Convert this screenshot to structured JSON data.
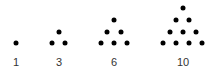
{
  "color": "#000000",
  "groups": [
    {
      "label": "1",
      "label_x": 16,
      "dots": [
        [
          16,
          43
        ]
      ]
    },
    {
      "label": "3",
      "label_x": 59,
      "dots": [
        [
          59,
          32
        ],
        [
          52,
          43
        ],
        [
          65,
          43
        ]
      ]
    },
    {
      "label": "6",
      "label_x": 114,
      "dots": [
        [
          114,
          20
        ],
        [
          107,
          32
        ],
        [
          121,
          32
        ],
        [
          101,
          43
        ],
        [
          114,
          43
        ],
        [
          127,
          43
        ]
      ]
    },
    {
      "label": "10",
      "label_x": 183,
      "dots": [
        [
          183,
          8
        ],
        [
          176,
          20
        ],
        [
          189,
          20
        ],
        [
          170,
          32
        ],
        [
          183,
          32
        ],
        [
          196,
          32
        ],
        [
          163,
          43
        ],
        [
          176,
          43
        ],
        [
          189,
          43
        ],
        [
          202,
          43
        ]
      ]
    }
  ]
}
